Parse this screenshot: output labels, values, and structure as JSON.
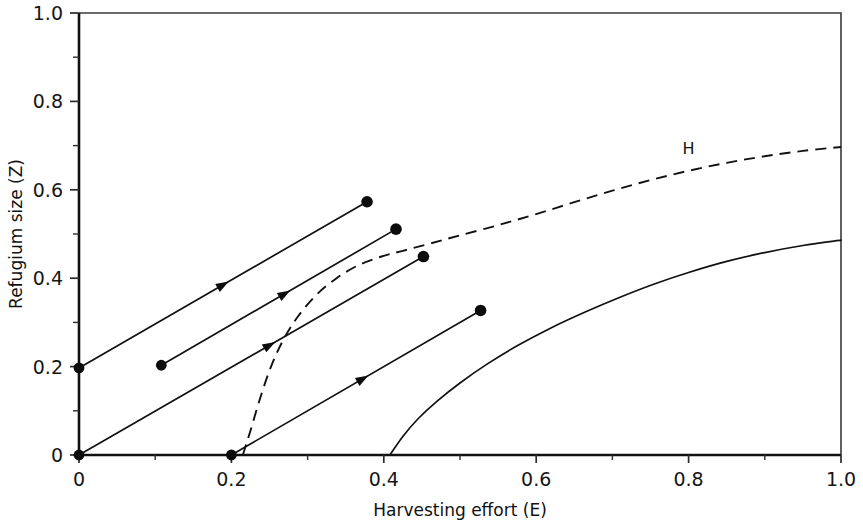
{
  "chart_data": {
    "type": "line",
    "title": "",
    "xlabel": "Harvesting effort (E)",
    "ylabel": "Refugium size (Z)",
    "xlim": [
      0,
      1
    ],
    "ylim": [
      0,
      1
    ],
    "grid": false,
    "legend": "none",
    "xticks": [
      0,
      0.2,
      0.4,
      0.6,
      0.8,
      1.0
    ],
    "xticklabels": [
      "0",
      "0.2",
      "0.4",
      "0.6",
      "0.8",
      "1.0"
    ],
    "yticks": [
      0,
      0.2,
      0.4,
      0.6,
      0.8,
      1.0
    ],
    "yticklabels": [
      "0",
      "0.2",
      "0.4",
      "0.6",
      "0.8",
      "1.0"
    ],
    "xminorticks": [
      0.1,
      0.3,
      0.5,
      0.7,
      0.9
    ],
    "yminorticks": [
      0.1,
      0.3,
      0.5,
      0.7,
      0.9
    ],
    "annotations": [
      {
        "text": "H",
        "x": 0.8,
        "y": 0.68,
        "name": "curve-label-h"
      }
    ],
    "series": [
      {
        "name": "H isocline (dashed)",
        "style": "dashed",
        "points": [
          [
            0.215,
            0.0
          ],
          [
            0.225,
            0.055
          ],
          [
            0.238,
            0.13
          ],
          [
            0.252,
            0.2
          ],
          [
            0.268,
            0.26
          ],
          [
            0.288,
            0.315
          ],
          [
            0.312,
            0.363
          ],
          [
            0.338,
            0.4
          ],
          [
            0.365,
            0.428
          ],
          [
            0.395,
            0.448
          ],
          [
            0.425,
            0.462
          ],
          [
            0.46,
            0.478
          ],
          [
            0.5,
            0.497
          ],
          [
            0.55,
            0.52
          ],
          [
            0.6,
            0.545
          ],
          [
            0.65,
            0.572
          ],
          [
            0.7,
            0.598
          ],
          [
            0.75,
            0.622
          ],
          [
            0.8,
            0.643
          ],
          [
            0.85,
            0.661
          ],
          [
            0.9,
            0.676
          ],
          [
            0.95,
            0.688
          ],
          [
            1.0,
            0.697
          ]
        ]
      },
      {
        "name": "Lower isocline (solid)",
        "style": "solid",
        "points": [
          [
            0.408,
            0.0
          ],
          [
            0.425,
            0.042
          ],
          [
            0.445,
            0.082
          ],
          [
            0.47,
            0.122
          ],
          [
            0.5,
            0.163
          ],
          [
            0.535,
            0.205
          ],
          [
            0.575,
            0.247
          ],
          [
            0.62,
            0.288
          ],
          [
            0.665,
            0.324
          ],
          [
            0.71,
            0.357
          ],
          [
            0.755,
            0.387
          ],
          [
            0.8,
            0.413
          ],
          [
            0.85,
            0.438
          ],
          [
            0.9,
            0.458
          ],
          [
            0.95,
            0.474
          ],
          [
            1.0,
            0.486
          ]
        ]
      }
    ],
    "trajectories": [
      {
        "name": "trajectory-1",
        "start": [
          0.0,
          0.197
        ],
        "end": [
          0.378,
          0.573
        ],
        "arrow_at": 0.52,
        "start_marker": true,
        "end_marker": true
      },
      {
        "name": "trajectory-2",
        "start": [
          0.108,
          0.203
        ],
        "end": [
          0.416,
          0.511
        ],
        "arrow_at": 0.55,
        "start_marker": true,
        "end_marker": true
      },
      {
        "name": "trajectory-3",
        "start": [
          0.0,
          0.0
        ],
        "end": [
          0.452,
          0.449
        ],
        "arrow_at": 0.57,
        "start_marker": true,
        "end_marker": true
      },
      {
        "name": "trajectory-4",
        "start": [
          0.2,
          0.0
        ],
        "end": [
          0.527,
          0.327
        ],
        "arrow_at": 0.55,
        "start_marker": true,
        "end_marker": true
      }
    ]
  }
}
